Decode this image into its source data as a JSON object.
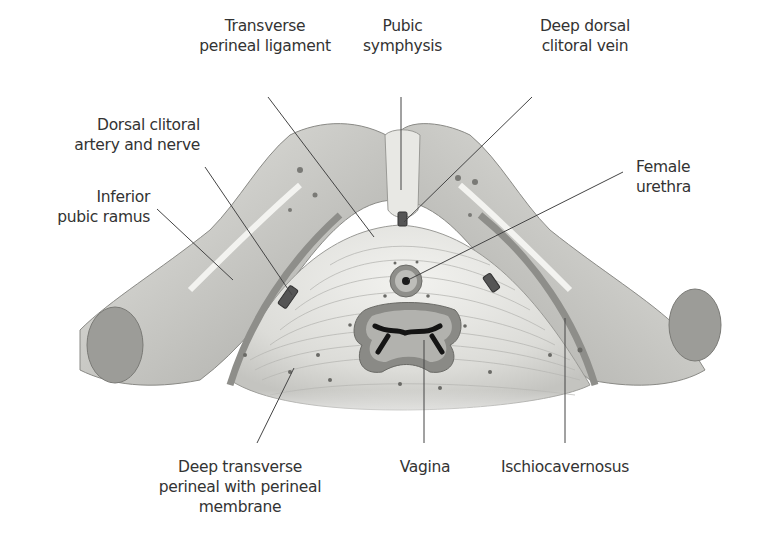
{
  "figure": {
    "labels": {
      "transverse_perineal_ligament": {
        "line1": "Transverse",
        "line2": "perineal ligament"
      },
      "pubic_symphysis": {
        "line1": "Pubic",
        "line2": "symphysis"
      },
      "deep_dorsal_clitoral_vein": {
        "line1": "Deep dorsal",
        "line2": "clitoral vein"
      },
      "dorsal_clitoral_artery_nerve": {
        "line1": "Dorsal clitoral",
        "line2": "artery and nerve"
      },
      "inferior_pubic_ramus": {
        "line1": "Inferior",
        "line2": "pubic ramus"
      },
      "female_urethra": {
        "line1": "Female",
        "line2": "urethra"
      },
      "deep_transverse_perineal": {
        "line1": "Deep transverse",
        "line2": "perineal with perineal",
        "line3": "membrane"
      },
      "vagina": {
        "line1": "Vagina"
      },
      "ischiocavernosus": {
        "line1": "Ischiocavernosus"
      }
    },
    "colors": {
      "text": "#333333",
      "leader_line": "#444444",
      "bone": "#d9d9d5",
      "bone_shadow": "#9a9a96",
      "membrane": "#e6e6e2",
      "muscle_fiber": "#b5b5b0",
      "vagina_wall": "#8c8c88",
      "lumen": "#1a1a1a"
    }
  }
}
